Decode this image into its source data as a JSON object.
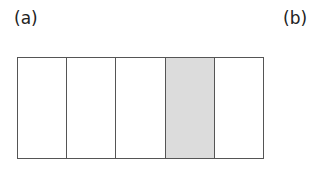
{
  "labels": {
    "a": "(a)",
    "b": "(b)"
  },
  "strip": {
    "cells": [
      {
        "shaded": false
      },
      {
        "shaded": false
      },
      {
        "shaded": false
      },
      {
        "shaded": true
      },
      {
        "shaded": false
      }
    ],
    "shade_color": "#dcdcdc",
    "border_color": "#555555"
  }
}
